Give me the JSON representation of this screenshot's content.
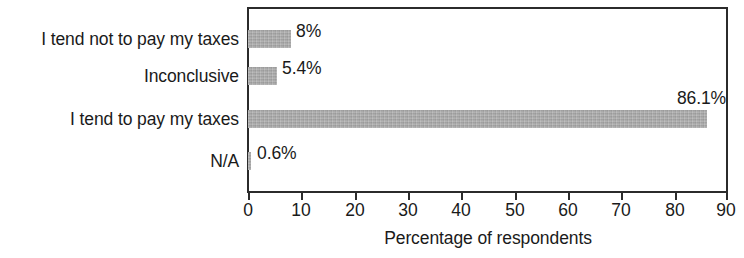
{
  "chart_data": {
    "type": "bar",
    "orientation": "horizontal",
    "title": "",
    "subtitle": "",
    "xlabel": "Percentage of respondents",
    "ylabel": "",
    "xlim": [
      0,
      90
    ],
    "xticks": [
      0,
      10,
      20,
      30,
      40,
      50,
      60,
      70,
      80,
      90
    ],
    "xtick_labels": [
      "0",
      "10",
      "20",
      "30",
      "40",
      "50",
      "60",
      "70",
      "80",
      "90"
    ],
    "grid": false,
    "legend": null,
    "bar_color": "#a9a9a9",
    "axis_color": "#2b2b2b",
    "categories": [
      "I tend not to pay my taxes",
      "Inconclusive",
      "I tend to pay my taxes",
      "N/A"
    ],
    "values": [
      8,
      5.4,
      86.1,
      0.6
    ],
    "data_labels": [
      "8%",
      "5.4%",
      "86.1%",
      "0.6%"
    ],
    "bars": [
      {
        "category": "I tend not to pay my taxes",
        "value": 8,
        "label": "8%",
        "label_position": "outside-end"
      },
      {
        "category": "Inconclusive",
        "value": 5.4,
        "label": "5.4%",
        "label_position": "outside-end"
      },
      {
        "category": "I tend to pay my taxes",
        "value": 86.1,
        "label": "86.1%",
        "label_position": "above-end"
      },
      {
        "category": "N/A",
        "value": 0.6,
        "label": "0.6%",
        "label_position": "outside-end"
      }
    ]
  }
}
